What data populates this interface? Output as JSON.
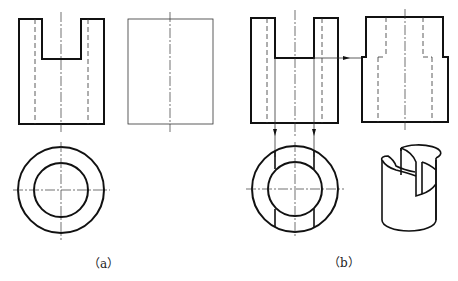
{
  "figure": {
    "panels": [
      {
        "id": "a",
        "label": "（a）",
        "views": [
          "front-view",
          "side-view-blank",
          "top-view"
        ]
      },
      {
        "id": "b",
        "label": "（b）",
        "views": [
          "front-view",
          "side-view",
          "top-view",
          "isometric-view"
        ]
      }
    ],
    "colors": {
      "line": "#111111",
      "background": "#ffffff"
    }
  }
}
